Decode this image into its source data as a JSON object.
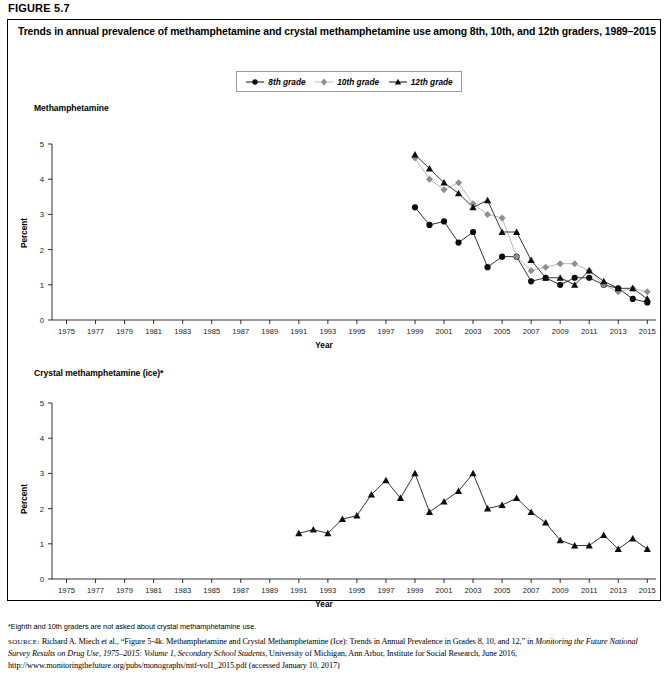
{
  "figure": {
    "label": "FIGURE 5.7",
    "title": "Trends in annual prevalence of methamphetamine and crystal methamphetamine use among 8th, 10th, and 12th graders, 1989–2015"
  },
  "legend": {
    "position": "top-center",
    "items": [
      {
        "label": "8th grade",
        "marker": "circle-marker-icon",
        "color": "#0d0d0d"
      },
      {
        "label": "10th grade",
        "marker": "diamond-marker-icon",
        "color": "#8e8e8e"
      },
      {
        "label": "12th grade",
        "marker": "triangle-marker-icon",
        "color": "#0d0d0d"
      }
    ]
  },
  "footnote": "*Eighth and 10th graders are not asked about crystal methamphetamine use.",
  "source": {
    "prefix": "SOURCE:",
    "part1": " Richard A. Miech et al., “Figure 5-4k. Methamphetamine and Crystal Methamphetamine (Ice): Trends in Annual Prevalence in Grades 8, 10, and 12,” in ",
    "italic": "Monitoring the Future National Survey Results on Drug Use, 1975–2015: Volume 1, Secondary School Students",
    "part2": ", University of Michigan, Ann Arbor, Institute for Social Research, June 2016, http://www.monitoringthefuture.org/pubs/monographs/mtf-vol1_2015.pdf (accessed January 10, 2017)"
  },
  "chart_data": [
    {
      "type": "line",
      "title": "Methamphetamine",
      "xlabel": "Year",
      "ylabel": "Percent",
      "ylim": [
        0,
        5
      ],
      "yticks": [
        0,
        1,
        2,
        3,
        4,
        5
      ],
      "xlim": [
        1974,
        2015.6
      ],
      "xticks": [
        1975,
        1977,
        1979,
        1981,
        1983,
        1985,
        1987,
        1989,
        1991,
        1993,
        1995,
        1997,
        1999,
        2001,
        2003,
        2005,
        2007,
        2009,
        2011,
        2013,
        2015
      ],
      "grid": false,
      "legend_position": "top-center",
      "series": [
        {
          "name": "8th grade",
          "marker": "circle",
          "color": "#0d0d0d",
          "x": [
            1999,
            2000,
            2001,
            2002,
            2003,
            2004,
            2005,
            2006,
            2007,
            2008,
            2009,
            2010,
            2011,
            2012,
            2013,
            2014,
            2015
          ],
          "values": [
            3.2,
            2.7,
            2.8,
            2.2,
            2.5,
            1.5,
            1.8,
            1.8,
            1.1,
            1.2,
            1.0,
            1.2,
            1.2,
            1.0,
            0.9,
            0.6,
            0.5
          ]
        },
        {
          "name": "10th grade",
          "marker": "diamond",
          "color": "#8e8e8e",
          "x": [
            1999,
            2000,
            2001,
            2002,
            2003,
            2004,
            2005,
            2006,
            2007,
            2008,
            2009,
            2010,
            2011,
            2012,
            2013,
            2014,
            2015
          ],
          "values": [
            4.6,
            4.0,
            3.7,
            3.9,
            3.3,
            3.0,
            2.9,
            1.8,
            1.4,
            1.5,
            1.6,
            1.6,
            1.4,
            1.0,
            0.8,
            0.9,
            0.8
          ]
        },
        {
          "name": "12th grade",
          "marker": "triangle",
          "color": "#0d0d0d",
          "x": [
            1999,
            2000,
            2001,
            2002,
            2003,
            2004,
            2005,
            2006,
            2007,
            2008,
            2009,
            2010,
            2011,
            2012,
            2013,
            2014,
            2015
          ],
          "values": [
            4.7,
            4.3,
            3.9,
            3.6,
            3.2,
            3.4,
            2.5,
            2.5,
            1.7,
            1.2,
            1.2,
            1.0,
            1.4,
            1.1,
            0.9,
            0.9,
            0.6
          ]
        }
      ]
    },
    {
      "type": "line",
      "title": "Crystal methamphetamine (ice)*",
      "xlabel": "Year",
      "ylabel": "Percent",
      "ylim": [
        0,
        5
      ],
      "yticks": [
        0,
        1,
        2,
        3,
        4,
        5
      ],
      "xlim": [
        1974,
        2015.6
      ],
      "xticks": [
        1975,
        1977,
        1979,
        1981,
        1983,
        1985,
        1987,
        1989,
        1991,
        1993,
        1995,
        1997,
        1999,
        2001,
        2003,
        2005,
        2007,
        2009,
        2011,
        2013,
        2015
      ],
      "grid": false,
      "series": [
        {
          "name": "12th grade",
          "marker": "triangle",
          "color": "#0d0d0d",
          "x": [
            1991,
            1992,
            1993,
            1994,
            1995,
            1996,
            1997,
            1998,
            1999,
            2000,
            2001,
            2002,
            2003,
            2004,
            2005,
            2006,
            2007,
            2008,
            2009,
            2010,
            2011,
            2012,
            2013,
            2014,
            2015
          ],
          "values": [
            1.3,
            1.4,
            1.3,
            1.7,
            1.8,
            2.4,
            2.8,
            2.3,
            3.0,
            1.9,
            2.2,
            2.5,
            3.0,
            2.0,
            2.1,
            2.3,
            1.9,
            1.6,
            1.1,
            0.95,
            0.95,
            1.25,
            0.85,
            1.15,
            0.85
          ]
        }
      ]
    }
  ]
}
